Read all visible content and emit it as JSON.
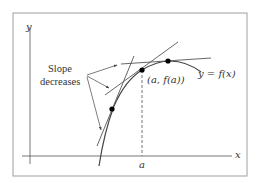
{
  "diagram": {
    "type": "concave-down curve with tangent lines",
    "axes": {
      "x_label": "x",
      "y_label": "y"
    },
    "annotation": {
      "line1": "Slope",
      "line2": "decreases"
    },
    "point_label": "(a, f(a))",
    "curve_label": "y = f(x)",
    "tick_label": "a",
    "points": [
      {
        "name": "left-point",
        "x": 112,
        "y": 109
      },
      {
        "name": "point-a",
        "x": 142,
        "y": 70
      },
      {
        "name": "right-point",
        "x": 168,
        "y": 61
      }
    ],
    "colors": {
      "line": "#555555",
      "frame": "#999999",
      "point": "#000000"
    }
  }
}
